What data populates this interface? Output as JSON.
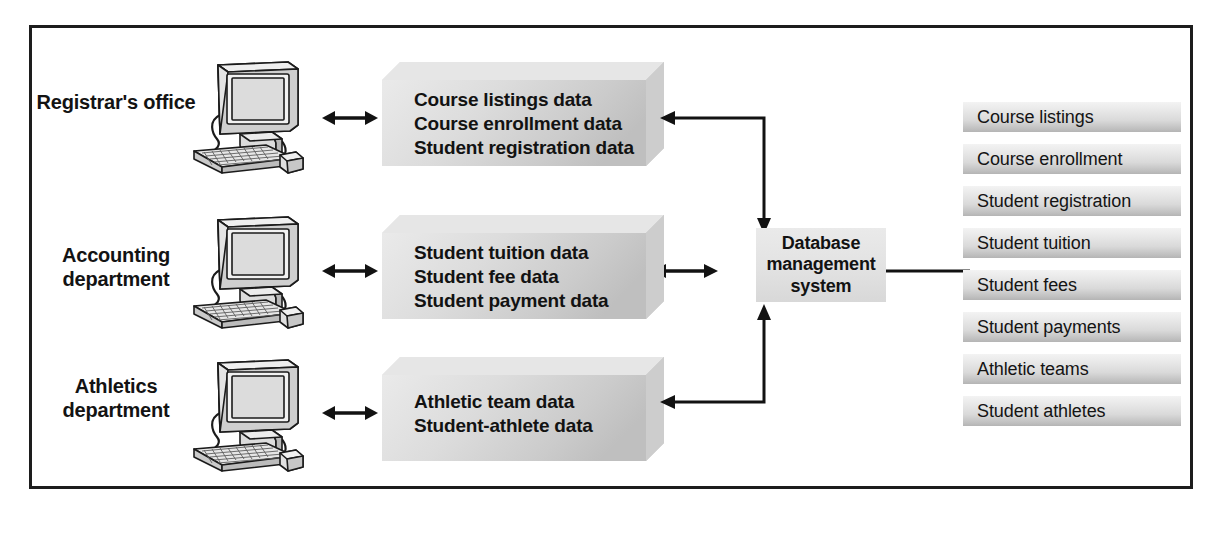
{
  "diagram": {
    "colors": {
      "frame_border": "#1d1d1d",
      "text": "#121212",
      "box_fill_light": "#ededed",
      "box_fill_dark": "#bdbdbd",
      "arrow": "#121212"
    }
  },
  "departments": [
    {
      "label": "Registrar's\noffice",
      "icon": "computer-icon"
    },
    {
      "label": "Accounting\ndepartment",
      "icon": "computer-icon"
    },
    {
      "label": "Athletics\ndepartment",
      "icon": "computer-icon"
    }
  ],
  "data_boxes": [
    {
      "lines": [
        "Course listings data",
        "Course enrollment data",
        "Student registration data"
      ],
      "text": "Course listings data\nCourse enrollment data\nStudent registration data"
    },
    {
      "lines": [
        "Student tuition data",
        "Student fee data",
        "Student payment data"
      ],
      "text": "Student tuition data\nStudent fee data\nStudent payment data"
    },
    {
      "lines": [
        "Athletic team data",
        "Student-athlete data"
      ],
      "text": "Athletic team data\nStudent-athlete data"
    }
  ],
  "dbms": {
    "label": "Database\nmanagement\nsystem",
    "lines": [
      "Database",
      "management",
      "system"
    ]
  },
  "tables": [
    {
      "label": "Course listings"
    },
    {
      "label": "Course enrollment"
    },
    {
      "label": "Student registration"
    },
    {
      "label": "Student tuition"
    },
    {
      "label": "Student fees"
    },
    {
      "label": "Student payments"
    },
    {
      "label": "Athletic teams"
    },
    {
      "label": "Student athletes"
    }
  ],
  "connectors": [
    {
      "name": "registrar-to-dbms",
      "kind": "elbow-double-arrow"
    },
    {
      "name": "accounting-to-dbms",
      "kind": "horizontal-double-arrow"
    },
    {
      "name": "athletics-to-dbms",
      "kind": "elbow-double-arrow"
    },
    {
      "name": "dbms-to-tables",
      "kind": "plain-line"
    }
  ]
}
